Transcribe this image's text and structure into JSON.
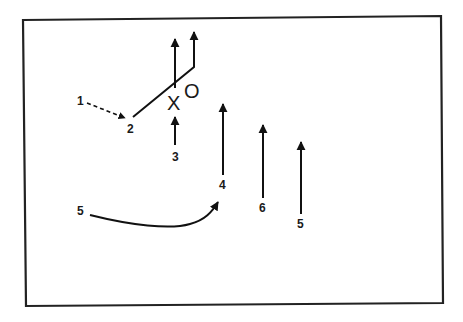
{
  "diagram": {
    "type": "play-diagram",
    "colors": {
      "line": "#111111",
      "frame": "#222222",
      "background": "#ffffff"
    },
    "symbols": {
      "x_marker": "X",
      "o_marker": "O"
    },
    "labels": {
      "player_1": "1",
      "player_2": "2",
      "player_3": "3",
      "player_4": "4",
      "player_5_left": "5",
      "player_6": "6",
      "player_5_right": "5"
    },
    "routes": [
      {
        "from": "1",
        "to": "2",
        "style": "dashed",
        "description": "pass from 1 to 2"
      },
      {
        "from": "2",
        "style": "solid",
        "description": "diagonal run past X, then up"
      },
      {
        "from": "X",
        "style": "solid",
        "description": "straight up"
      },
      {
        "from": "3",
        "style": "solid",
        "description": "up toward X"
      },
      {
        "from": "4",
        "style": "solid",
        "description": "straight up"
      },
      {
        "from": "5",
        "to": "4",
        "style": "solid-curve",
        "description": "curved run to 4"
      },
      {
        "from": "6",
        "style": "solid",
        "description": "straight up"
      },
      {
        "from": "5",
        "style": "solid",
        "description": "straight up (right)"
      }
    ]
  }
}
